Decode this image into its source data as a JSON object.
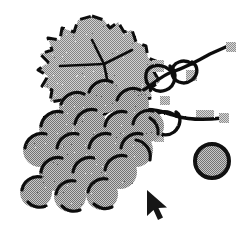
{
  "canvas": {
    "width": 247,
    "height": 231,
    "background_color": "#ffffff",
    "style": "dithered-grayscale-clipart"
  },
  "palette": {
    "outline": "#111111",
    "grape_fill": "#a8a8a8",
    "leaf_fill": "#b4b4b4",
    "tendril_highlight": "#b0b0b0",
    "cursor_fill": "#161616",
    "background": "#ffffff"
  },
  "artwork": {
    "title": "Grape cluster with leaf and tendrils",
    "parts": [
      {
        "name": "leaf",
        "label": "Grape leaf"
      },
      {
        "name": "tendrils",
        "label": "Curling vine tendrils"
      },
      {
        "name": "grape-cluster",
        "label": "Bunch of grapes"
      },
      {
        "name": "single-grape",
        "label": "Detached single grape"
      }
    ]
  },
  "leaf": {
    "label": "Grape leaf",
    "fill": "#b4b4b4",
    "outline": "#111111",
    "path": "M 92 16 L 104 20 L 110 28 L 118 22 L 124 32 L 132 30 L 136 42 L 146 46 L 148 58 L 158 62 L 154 72 L 160 82 L 150 88 L 152 98 L 140 100 L 136 112 L 126 108 L 118 116 L 110 110 L 100 118 L 94 110 L 84 116 L 78 106 L 66 112 L 62 100 L 50 102 L 52 90 L 42 86 L 48 76 L 38 70 L 48 62 L 40 54 L 52 50 L 48 38 L 60 40 L 62 28 L 74 32 L 78 20 Z"
  },
  "grapes": {
    "label": "Grape cluster",
    "fill": "#a8a8a8",
    "outline": "#111111",
    "radius": 17,
    "berries": [
      {
        "cx": 104,
        "cy": 96,
        "r": 17
      },
      {
        "cx": 76,
        "cy": 108,
        "r": 17
      },
      {
        "cx": 132,
        "cy": 104,
        "r": 17
      },
      {
        "cx": 56,
        "cy": 128,
        "r": 17
      },
      {
        "cx": 90,
        "cy": 126,
        "r": 17
      },
      {
        "cx": 120,
        "cy": 128,
        "r": 17
      },
      {
        "cx": 148,
        "cy": 126,
        "r": 16
      },
      {
        "cx": 40,
        "cy": 150,
        "r": 17
      },
      {
        "cx": 72,
        "cy": 150,
        "r": 17
      },
      {
        "cx": 104,
        "cy": 150,
        "r": 17
      },
      {
        "cx": 136,
        "cy": 150,
        "r": 17
      },
      {
        "cx": 56,
        "cy": 174,
        "r": 17
      },
      {
        "cx": 88,
        "cy": 174,
        "r": 17
      },
      {
        "cx": 120,
        "cy": 172,
        "r": 17
      },
      {
        "cx": 36,
        "cy": 192,
        "r": 16
      },
      {
        "cx": 70,
        "cy": 196,
        "r": 16
      },
      {
        "cx": 102,
        "cy": 194,
        "r": 16
      }
    ]
  },
  "single_grape": {
    "label": "Detached grape",
    "cx": 212,
    "cy": 161,
    "r": 18,
    "fill": "#a8a8a8",
    "outline": "#111111",
    "stroke_width": 4
  },
  "tendrils": {
    "label": "Vine tendrils",
    "stroke": "#111111",
    "stroke_width": 3.4,
    "paths": [
      "M 140 92 C 152 86, 160 76, 172 72 C 184 68, 196 62, 210 54 L 228 46",
      "M 172 72 C 162 62, 148 64, 146 74 C 144 86, 156 94, 166 90 C 176 86, 178 72, 170 66",
      "M 192 64 C 184 58, 172 62, 172 72 C 172 82, 184 86, 192 80 C 199 74, 198 66, 192 62",
      "M 140 110 C 152 108, 164 112, 176 116 C 190 120, 206 120, 222 118",
      "M 176 116 C 166 108, 152 112, 152 122 C 152 134, 166 138, 174 132 C 181 126, 182 116, 176 112",
      "M 146 118 C 152 128, 150 140, 142 146"
    ],
    "caps": [
      {
        "x": 226,
        "y": 42,
        "w": 10,
        "h": 10
      },
      {
        "x": 219,
        "y": 113,
        "w": 10,
        "h": 10
      }
    ],
    "highlights": [
      {
        "x": 152,
        "y": 60,
        "w": 12,
        "h": 12
      },
      {
        "x": 186,
        "y": 70,
        "w": 11,
        "h": 11
      },
      {
        "x": 196,
        "y": 110,
        "w": 18,
        "h": 8
      },
      {
        "x": 154,
        "y": 132,
        "w": 10,
        "h": 10
      }
    ]
  },
  "cursor": {
    "name": "mouse-pointer",
    "label": "Mouse cursor arrow",
    "x": 147,
    "y": 190,
    "fill": "#161616",
    "path": "M 0 0 L 0 26 L 6.5 20 L 11 30 L 16 27.5 L 11.5 18 L 20 17.5 Z"
  }
}
